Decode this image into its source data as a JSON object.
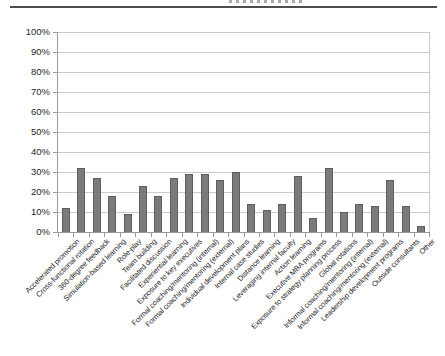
{
  "page": {
    "header_divider": true
  },
  "chart_data": {
    "type": "bar",
    "title": "",
    "xlabel": "",
    "ylabel": "",
    "ylim": [
      0,
      100
    ],
    "grid": true,
    "legend": "none",
    "yticks": [
      "0%",
      "10%",
      "20%",
      "30%",
      "40%",
      "50%",
      "60%",
      "70%",
      "80%",
      "90%",
      "100%"
    ],
    "categories": [
      "Accelerated promotion",
      "Cross-functional rotation",
      "360-degree feedback",
      "Simulation-based learning",
      "Role-play",
      "Team building",
      "Facilitated discussion",
      "Experiential learning",
      "Exposure to key executives",
      "Formal coaching/mentoring (internal)",
      "Formal coaching/mentoring (external)",
      "Individual development plans",
      "Internal case studies",
      "Distance learning",
      "Leveraging internal faculty",
      "Action learning",
      "Executive MBA programs",
      "Exposure to strategy planning process",
      "Global rotations",
      "Informal coaching/mentoring (internal)",
      "Informal coaching/mentoring (external)",
      "Leadership development programs",
      "Outside consultants",
      "Other"
    ],
    "values": [
      12,
      32,
      27,
      18,
      9,
      23,
      18,
      27,
      29,
      29,
      26,
      30,
      14,
      11,
      14,
      28,
      7,
      32,
      10,
      14,
      13,
      26,
      13,
      3
    ],
    "value_suffix": "%",
    "colors": {
      "bar": "#7b7b7b",
      "bar_border": "#5e5e5e",
      "grid": "#cccccc",
      "axis": "#999999",
      "label": "#1f1f1f",
      "divider": "#4d4d4d"
    }
  }
}
